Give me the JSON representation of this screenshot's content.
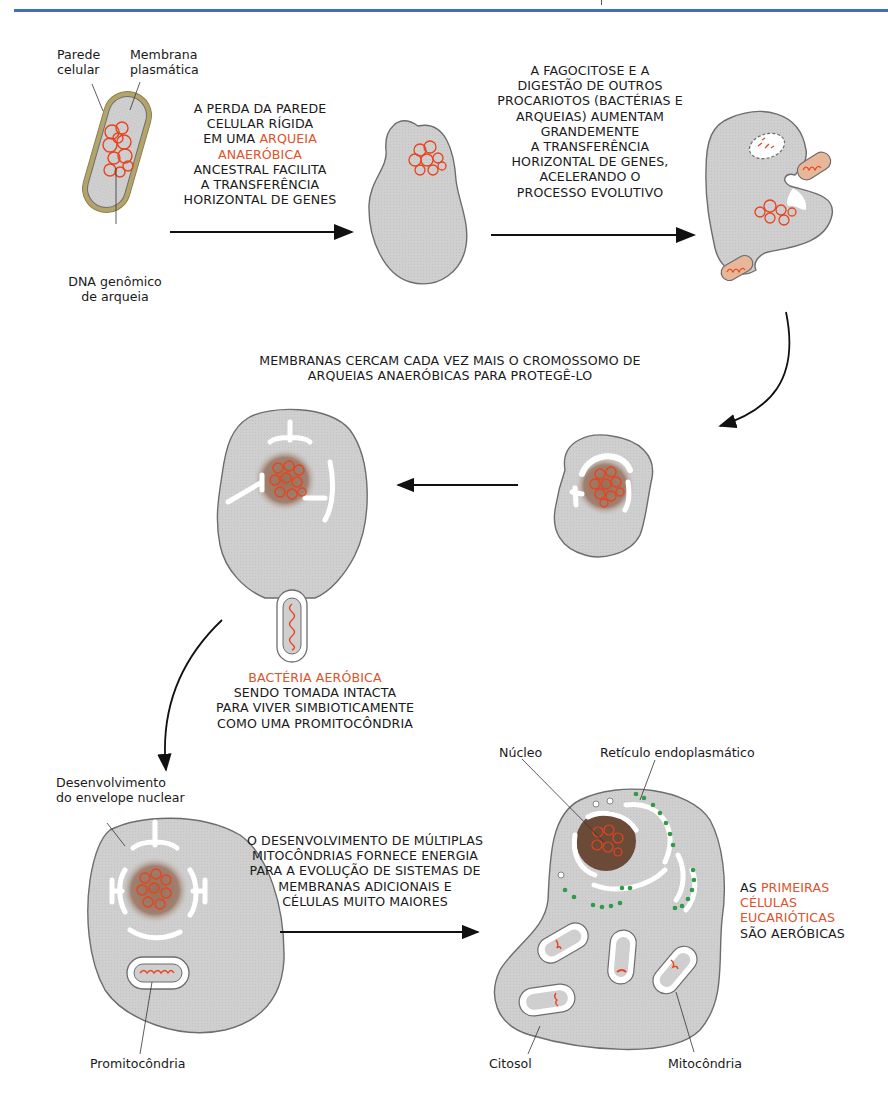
{
  "header": {
    "rule_color": "#3f6fb5"
  },
  "colors": {
    "cell_fill": "#cfcfcf",
    "cell_stroke": "#6d6d6d",
    "dna": "#e8431e",
    "wall": "#b3a56a",
    "nucleus": "#8b6a55",
    "ribosome": "#2f9a47",
    "highlight_text": "#e0522a"
  },
  "stage1": {
    "labels": {
      "cell_wall": [
        "Parede",
        "celular"
      ],
      "plasma_membrane": [
        "Membrana",
        "plasmática"
      ],
      "genomic_dna": [
        "DNA genômico",
        "de arqueia"
      ]
    },
    "caption": {
      "line1": "A PERDA DA PAREDE",
      "line2": "CELULAR RÍGIDA",
      "line3_pre": "EM UMA ",
      "line3_red": "ARQUEIA",
      "line4_red": "ANAERÓBICA",
      "line5": "ANCESTRAL FACILITA",
      "line6": "A TRANSFERÊNCIA",
      "line7": "HORIZONTAL DE GENES"
    }
  },
  "stage2": {
    "caption": [
      "A FAGOCITOSE E A",
      "DIGESTÃO DE OUTROS",
      "PROCARIOTOS (BACTÉRIAS E",
      "ARQUEIAS) AUMENTAM",
      "GRANDEMENTE",
      "A TRANSFERÊNCIA",
      "HORIZONTAL DE GENES,",
      "ACELERANDO O",
      "PROCESSO EVOLUTIVO"
    ]
  },
  "stage3": {
    "caption": [
      "MEMBRANAS CERCAM CADA VEZ MAIS O CROMOSSOMO DE",
      "ARQUEIAS ANAERÓBICAS PARA PROTEGÊ-LO"
    ]
  },
  "stage4": {
    "caption_red": "BACTÉRIA AERÓBICA",
    "caption": [
      "SENDO TOMADA INTACTA",
      "PARA VIVER SIMBIOTICAMENTE",
      "COMO UMA PROMITOCÔNDRIA"
    ]
  },
  "stage5": {
    "labels": {
      "nuclear_envelope": [
        "Desenvolvimento",
        "do envelope nuclear"
      ],
      "promitochondrion": "Promitocôndria"
    },
    "caption": [
      "O DESENVOLVIMENTO DE MÚLTIPLAS",
      "MITOCÔNDRIAS FORNECE ENERGIA",
      "PARA A EVOLUÇÃO DE SISTEMAS DE",
      "MEMBRANAS ADICIONAIS E",
      "CÉLULAS MUITO MAIORES"
    ]
  },
  "stage6": {
    "labels": {
      "nucleus": "Núcleo",
      "er": "Retículo endoplasmático",
      "cytosol": "Citosol",
      "mitochondrion": "Mitocôndria"
    },
    "caption": {
      "line1_pre": "AS ",
      "line1_red": "PRIMEIRAS",
      "line2_red": "CÉLULAS",
      "line3_red": "EUCARIÓTICAS",
      "line4": "SÃO AERÓBICAS"
    }
  }
}
